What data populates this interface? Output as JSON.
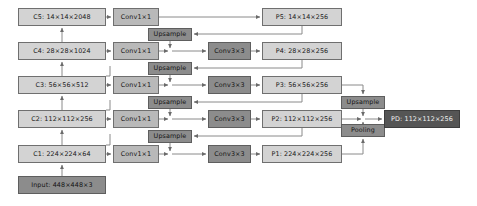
{
  "diagram": {
    "canvas": {
      "width": 477,
      "height": 206,
      "background": "#ffffff"
    },
    "palette": {
      "backbone_fill": "#d3d3d3",
      "lateral_fill": "#b9b9b9",
      "op_fill": "#8c8c8c",
      "output_fill": "#555555",
      "line": "#7a7a7a",
      "border": "#6f6f6f"
    },
    "backbone": [
      {
        "name": "c5",
        "label": "C5:  14×14×2048",
        "x": 18,
        "y": 8,
        "w": 88,
        "h": 18,
        "style": "fill-light"
      },
      {
        "name": "c4",
        "label": "C4:  28×28×1024",
        "x": 18,
        "y": 42,
        "w": 88,
        "h": 18,
        "style": "fill-light"
      },
      {
        "name": "c3",
        "label": "C3:  56×56×512",
        "x": 18,
        "y": 76,
        "w": 88,
        "h": 18,
        "style": "fill-light"
      },
      {
        "name": "c2",
        "label": "C2: 112×112×256",
        "x": 18,
        "y": 110,
        "w": 88,
        "h": 18,
        "style": "fill-light"
      },
      {
        "name": "c1",
        "label": "C1: 224×224×64",
        "x": 18,
        "y": 145,
        "w": 88,
        "h": 18,
        "style": "fill-light"
      },
      {
        "name": "input",
        "label": "Input: 448×448×3",
        "x": 18,
        "y": 176,
        "w": 88,
        "h": 18,
        "style": "fill-dark"
      }
    ],
    "lateral_convs": [
      {
        "name": "conv1x1-c5",
        "label": "Conv1×1",
        "x": 113,
        "y": 8,
        "w": 46,
        "h": 18,
        "style": "fill-mid"
      },
      {
        "name": "conv1x1-c4",
        "label": "Conv1×1",
        "x": 113,
        "y": 42,
        "w": 46,
        "h": 18,
        "style": "fill-mid"
      },
      {
        "name": "conv1x1-c3",
        "label": "Conv1×1",
        "x": 113,
        "y": 76,
        "w": 46,
        "h": 18,
        "style": "fill-mid"
      },
      {
        "name": "conv1x1-c2",
        "label": "Conv1×1",
        "x": 113,
        "y": 110,
        "w": 46,
        "h": 18,
        "style": "fill-mid"
      },
      {
        "name": "conv1x1-c1",
        "label": "Conv1×1",
        "x": 113,
        "y": 145,
        "w": 46,
        "h": 18,
        "style": "fill-mid"
      }
    ],
    "upsamples": [
      {
        "name": "upsample-p5-p4",
        "label": "Upsample",
        "x": 148,
        "y": 28,
        "w": 44,
        "h": 13,
        "style": "fill-dark"
      },
      {
        "name": "upsample-p4-p3",
        "label": "Upsample",
        "x": 148,
        "y": 62,
        "w": 44,
        "h": 13,
        "style": "fill-dark"
      },
      {
        "name": "upsample-p3-p2",
        "label": "Upsample",
        "x": 148,
        "y": 96,
        "w": 44,
        "h": 13,
        "style": "fill-dark"
      },
      {
        "name": "upsample-p2-p1",
        "label": "Upsample",
        "x": 148,
        "y": 130,
        "w": 44,
        "h": 13,
        "style": "fill-dark"
      }
    ],
    "smooth_convs": [
      {
        "name": "conv3x3-p4",
        "label": "Conv3×3",
        "x": 208,
        "y": 42,
        "w": 43,
        "h": 18,
        "style": "fill-dark"
      },
      {
        "name": "conv3x3-p3",
        "label": "Conv3×3",
        "x": 208,
        "y": 76,
        "w": 43,
        "h": 18,
        "style": "fill-dark"
      },
      {
        "name": "conv3x3-p2",
        "label": "Conv3×3",
        "x": 208,
        "y": 110,
        "w": 43,
        "h": 18,
        "style": "fill-dark"
      },
      {
        "name": "conv3x3-p1",
        "label": "Conv3×3",
        "x": 208,
        "y": 145,
        "w": 43,
        "h": 18,
        "style": "fill-dark"
      }
    ],
    "pyramid": [
      {
        "name": "p5",
        "label": "P5:  14×14×256",
        "x": 262,
        "y": 8,
        "w": 80,
        "h": 18,
        "style": "fill-light"
      },
      {
        "name": "p4",
        "label": "P4:  28×28×256",
        "x": 262,
        "y": 42,
        "w": 80,
        "h": 18,
        "style": "fill-light"
      },
      {
        "name": "p3",
        "label": "P3:  56×56×256",
        "x": 262,
        "y": 76,
        "w": 80,
        "h": 18,
        "style": "fill-light"
      },
      {
        "name": "p2",
        "label": "P2: 112×112×256",
        "x": 262,
        "y": 110,
        "w": 80,
        "h": 18,
        "style": "fill-light"
      },
      {
        "name": "p1",
        "label": "P1: 224×224×256",
        "x": 262,
        "y": 145,
        "w": 80,
        "h": 18,
        "style": "fill-light"
      }
    ],
    "merge_ops": [
      {
        "name": "upsample-final",
        "label": "Upsample",
        "x": 341,
        "y": 96,
        "w": 44,
        "h": 13,
        "style": "fill-dark"
      },
      {
        "name": "pooling-final",
        "label": "Pooling",
        "x": 341,
        "y": 124,
        "w": 44,
        "h": 13,
        "style": "fill-dark"
      }
    ],
    "output": {
      "name": "pd-output",
      "label": "PD: 112×112×256",
      "x": 384,
      "y": 110,
      "w": 76,
      "h": 18,
      "style": "fill-darkest"
    }
  }
}
